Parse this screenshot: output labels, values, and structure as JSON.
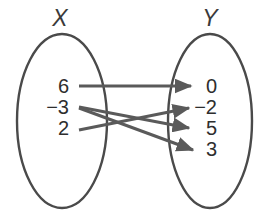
{
  "diagram": {
    "type": "mapping-diagram",
    "domain_set": {
      "label": "X",
      "elements": [
        "6",
        "−3",
        "2"
      ]
    },
    "range_set": {
      "label": "Y",
      "elements": [
        "0",
        "−2",
        "5",
        "3"
      ]
    },
    "mappings": [
      {
        "from": "6",
        "to": "0"
      },
      {
        "from": "−3",
        "to": "5"
      },
      {
        "from": "−3",
        "to": "3"
      },
      {
        "from": "2",
        "to": "−2"
      }
    ],
    "colors": {
      "stroke": "#4a4a4a",
      "arrow": "#5a5a5a",
      "text": "#2e2e2e",
      "background": "#ffffff"
    }
  }
}
